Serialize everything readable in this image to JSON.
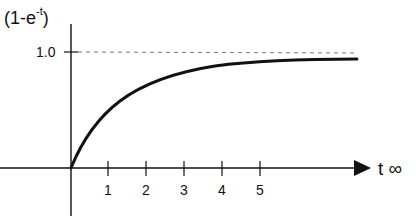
{
  "diagram": {
    "y_axis_label_prefix": "(1-e",
    "y_axis_label_exp": "-t",
    "y_axis_label_suffix": ")",
    "y_tick_label": "1.0",
    "x_axis_label": "t ∞",
    "x_ticks": [
      "1",
      "2",
      "3",
      "4",
      "5"
    ],
    "curve": "1 - e^-t (exponential approach to asymptote 1.0)",
    "asymptote": "dashed line at 1.0",
    "colors": {
      "curve": "#111111",
      "axis": "#111111",
      "asymptote": "#777777"
    }
  }
}
